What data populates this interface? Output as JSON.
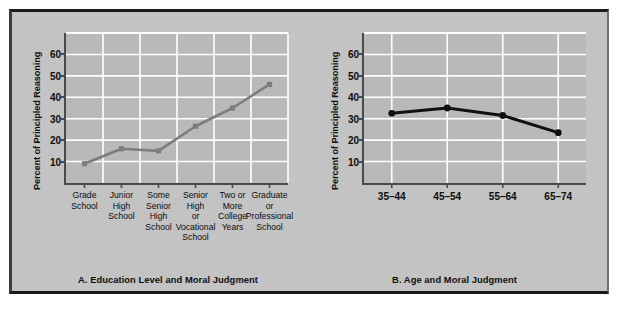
{
  "figure": {
    "background_color": "#c3c3c3",
    "plot_background_color": "#b9b9b9",
    "gridline_color": "#ffffff",
    "axis_color": "#4a4a4a"
  },
  "chart_data": [
    {
      "id": "a",
      "type": "line",
      "title": "A. Education Level and Moral Judgment",
      "xlabel": "",
      "ylabel": "Percent of Principled Reasoning",
      "categories": [
        "Grade School",
        "Junior High School",
        "Some Senior High School",
        "Senior High or Vocational School",
        "Two or More College Years",
        "Graduate or Professional School"
      ],
      "category_lines": [
        [
          "Grade",
          "School"
        ],
        [
          "Junior",
          "High",
          "School"
        ],
        [
          "Some",
          "Senior",
          "High",
          "School"
        ],
        [
          "Senior",
          "High",
          "or",
          "Vocational",
          "School"
        ],
        [
          "Two or",
          "More",
          "College",
          "Years"
        ],
        [
          "Graduate",
          "or",
          "Professional",
          "School"
        ]
      ],
      "values": [
        9,
        16,
        15,
        26.5,
        35,
        46
      ],
      "ylim": [
        0,
        70
      ],
      "yticks": [
        10,
        20,
        30,
        40,
        50,
        60
      ],
      "ytick_labels": [
        "10",
        "20",
        "30",
        "40",
        "50",
        "60"
      ],
      "gridlines_y": [
        10,
        20,
        30,
        40,
        50,
        60,
        70
      ],
      "grid": true,
      "legend": "none",
      "line_color": "#7d7d7d",
      "marker_color": "#7d7d7d",
      "marker": "square"
    },
    {
      "id": "b",
      "type": "line",
      "title": "B. Age and Moral Judgment",
      "xlabel": "",
      "ylabel": "Percent of Principled Reasoning",
      "categories": [
        "35–44",
        "45–54",
        "55–64",
        "65–74"
      ],
      "values": [
        32.5,
        35,
        31.5,
        23.5
      ],
      "ylim": [
        0,
        70
      ],
      "yticks": [
        10,
        20,
        30,
        40,
        50,
        60
      ],
      "ytick_labels": [
        "10",
        "20",
        "30",
        "40",
        "50",
        "60"
      ],
      "gridlines_y": [
        10,
        20,
        30,
        40,
        50,
        60,
        70
      ],
      "grid": true,
      "legend": "none",
      "line_color": "#101010",
      "marker_color": "#101010",
      "marker": "circle"
    }
  ]
}
